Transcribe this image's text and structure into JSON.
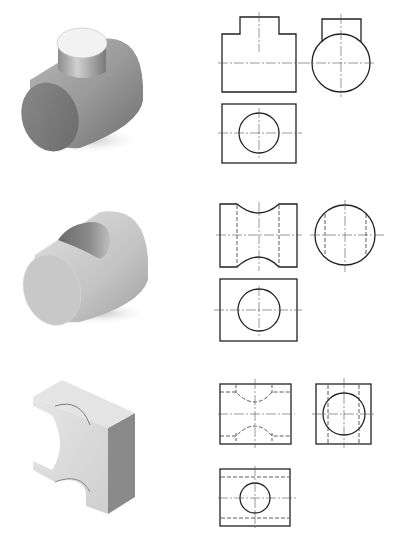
{
  "figure": {
    "type": "orthographic projection exercises",
    "clipped_header_text": "",
    "rows": [
      {
        "id": "row-1",
        "isometric": "horizontal cylinder with vertical cylinder boss on top (tee)",
        "views": [
          "front-view",
          "side-view",
          "top-view"
        ],
        "description": "Front view: rectangle with raised boss; side view: circle with rectangle boss; top view: rectangle with circle"
      },
      {
        "id": "row-2",
        "isometric": "cylinder with transverse cylindrical through-hole",
        "views": [
          "front-view",
          "side-view",
          "top-view"
        ],
        "description": "Front view: rectangle with concave arcs top and bottom, hidden lines; side view: circle with hidden lines; top view: rectangle with circle"
      },
      {
        "id": "row-3",
        "isometric": "rectangular block with cylindrical cutouts on both sides and a through-hole",
        "views": [
          "front-view",
          "side-view",
          "top-view"
        ],
        "description": "Front view: rectangle with dashed arcs; side view: square with circle and hidden lines; top view: rectangle with circle and dashed lines"
      }
    ]
  },
  "colors": {
    "line": "#222222",
    "centerline": "#555555",
    "shade_dark": "#6e6e6e",
    "shade_mid": "#9a9a9a",
    "shade_light": "#e8e8e8"
  }
}
